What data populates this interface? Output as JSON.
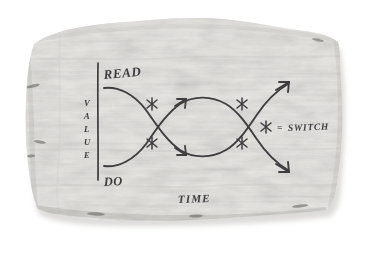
{
  "media": {
    "type": "photograph-of-torn-paper-sketch",
    "background_color": "#ffffff",
    "paper_color": "#f2f1ef",
    "paper_shadow_color": "#b9b7b2",
    "ink_color": "#3a3a3c"
  },
  "diagram": {
    "title": "",
    "axis": {
      "y_label": "VALUE",
      "y_label_letters": [
        "V",
        "A",
        "L",
        "U",
        "E"
      ],
      "x_label": "TIME",
      "axis_line_name": "value-axis-line"
    },
    "curve_labels": {
      "upper": "READ",
      "lower": "DO"
    },
    "legend": {
      "marker_glyph": "✳",
      "equals": "=",
      "text": "SWITCH",
      "full_text": "✳ = SWITCH"
    },
    "markers": {
      "name": "switch-marker",
      "glyph": "✳",
      "count": 4,
      "positions": [
        {
          "x": 152,
          "y": 104,
          "label": "crossing-1-upper"
        },
        {
          "x": 152,
          "y": 143,
          "label": "crossing-1-lower"
        },
        {
          "x": 242,
          "y": 104,
          "label": "crossing-2-upper"
        },
        {
          "x": 242,
          "y": 143,
          "label": "crossing-2-lower"
        }
      ]
    },
    "curves": [
      {
        "name": "read-curve",
        "starts_at": "upper-left",
        "ends_at": "lower-right",
        "description": "descends from READ, crosses DO twice, exits lower right with arrowhead"
      },
      {
        "name": "do-curve",
        "starts_at": "lower-left",
        "ends_at": "upper-right",
        "description": "ascends from DO, crosses READ twice, exits upper right with arrowhead"
      }
    ],
    "crossings": 2,
    "arrowheads": 4
  }
}
